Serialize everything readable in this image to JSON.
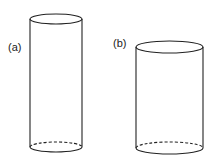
{
  "cylinders": [
    {
      "label": "(a)",
      "cx": 56,
      "rx": 26,
      "ry": 5,
      "top_y": 19,
      "bottom_y": 147
    },
    {
      "label": "(b)",
      "cx": 169.5,
      "rx": 33.5,
      "ry": 6,
      "top_y": 47,
      "bottom_y": 148
    }
  ],
  "colors": {
    "stroke": "#222222",
    "background": "#ffffff"
  }
}
